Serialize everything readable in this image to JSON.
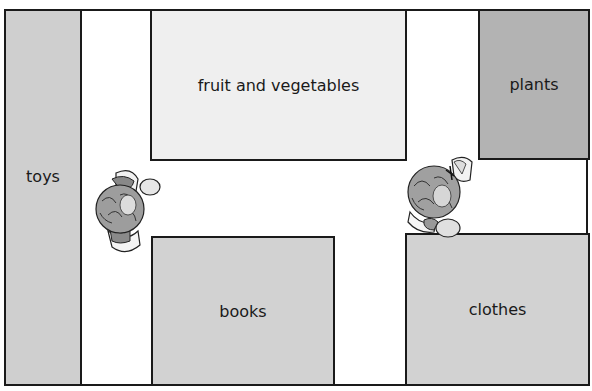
{
  "map": {
    "title": "",
    "areas": [
      {
        "id": "toys",
        "label": "toys",
        "color": "#cfcfcf"
      },
      {
        "id": "fruit",
        "label": "fruit and vegetables",
        "color": "#efefef"
      },
      {
        "id": "plants",
        "label": "plants",
        "color": "#b3b3b3"
      },
      {
        "id": "books",
        "label": "books",
        "color": "#d2d2d2"
      },
      {
        "id": "clothes",
        "label": "clothes",
        "color": "#d2d2d2"
      }
    ],
    "people": [
      {
        "id": "person-left",
        "description": "person viewed from above"
      },
      {
        "id": "person-right",
        "description": "person viewed from above"
      }
    ]
  }
}
